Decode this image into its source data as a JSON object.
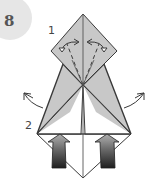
{
  "step": {
    "number": "8",
    "badge_color": "#e6e6e6"
  },
  "labels": [
    {
      "id": "1",
      "text": "1",
      "x": 48,
      "y": 24
    },
    {
      "id": "2",
      "text": "2",
      "x": 25,
      "y": 119
    }
  ],
  "colors": {
    "paper_shaded": "#c8c8c8",
    "paper_white": "#ffffff",
    "line": "#3a3a3a",
    "arrow_top": "#9a9a9a",
    "arrow_bottom": "#2a2a2a"
  },
  "diagram": {
    "annotations": [
      "fold-arrows-step-1",
      "swing-arrows-step-2",
      "push-arrows"
    ]
  }
}
